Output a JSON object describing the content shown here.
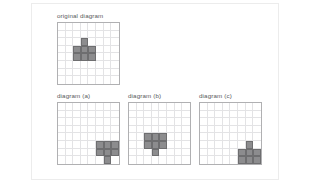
{
  "figure": {
    "background_color": "#ffffff",
    "panel_border_color": "#ececec",
    "grid_line_color": "#e3e3e5",
    "grid_border_color": "#b0b0b2",
    "shape_fill_color": "#8c8c8e",
    "shape_stroke_color": "#6e6e70",
    "label_color": "#58585a"
  },
  "diagrams": [
    {
      "id": "original",
      "label": "original diagram",
      "grid": {
        "cols": 8,
        "rows": 8,
        "cell_px": 7.6
      },
      "shape_name": "pentomino-T-block",
      "shape_cells": [
        [
          2,
          3
        ],
        [
          3,
          2
        ],
        [
          3,
          3
        ],
        [
          3,
          4
        ],
        [
          4,
          2
        ],
        [
          4,
          3
        ],
        [
          4,
          4
        ]
      ]
    },
    {
      "id": "a",
      "label": "diagram (a)",
      "grid": {
        "cols": 8,
        "rows": 8,
        "cell_px": 7.6
      },
      "shape_name": "pentomino-T-block-rotated-180",
      "shape_cells": [
        [
          5,
          5
        ],
        [
          5,
          6
        ],
        [
          5,
          7
        ],
        [
          6,
          5
        ],
        [
          6,
          6
        ],
        [
          6,
          7
        ],
        [
          7,
          6
        ]
      ]
    },
    {
      "id": "b",
      "label": "diagram (b)",
      "grid": {
        "cols": 8,
        "rows": 8,
        "cell_px": 7.6
      },
      "shape_name": "pentomino-T-block-flipped-vertical",
      "shape_cells": [
        [
          4,
          2
        ],
        [
          4,
          3
        ],
        [
          4,
          4
        ],
        [
          5,
          2
        ],
        [
          5,
          3
        ],
        [
          5,
          4
        ],
        [
          6,
          3
        ]
      ]
    },
    {
      "id": "c",
      "label": "diagram (c)",
      "grid": {
        "cols": 8,
        "rows": 8,
        "cell_px": 7.6
      },
      "shape_name": "pentomino-T-block-corner",
      "shape_cells": [
        [
          5,
          6
        ],
        [
          6,
          5
        ],
        [
          6,
          6
        ],
        [
          6,
          7
        ],
        [
          7,
          5
        ],
        [
          7,
          6
        ],
        [
          7,
          7
        ]
      ]
    }
  ]
}
